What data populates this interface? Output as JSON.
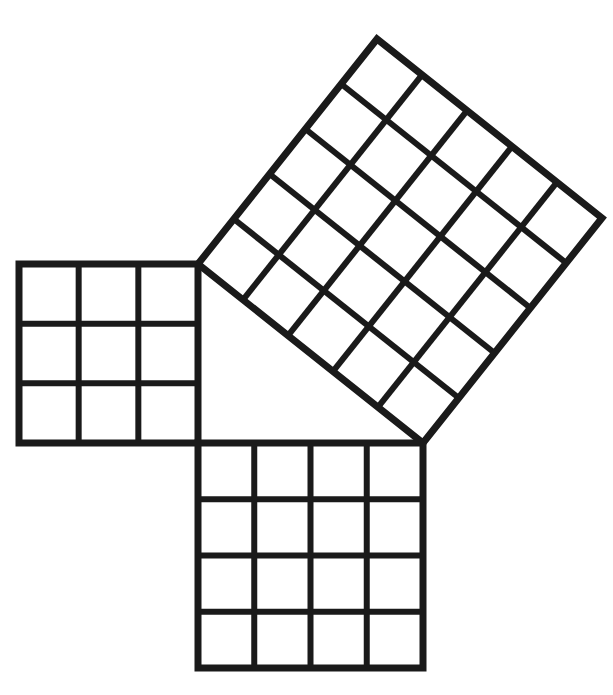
{
  "figure": {
    "background_color": "#ffffff",
    "line_color": "#1a1a1a",
    "canvas": {
      "width": 613,
      "height": 695
    },
    "triangle": {
      "name": "right-triangle",
      "vertices": {
        "right_angle": {
          "x": 198,
          "y": 443
        },
        "top": {
          "x": 198,
          "y": 264
        },
        "right": {
          "x": 423,
          "y": 443
        }
      },
      "side_lengths_units": {
        "a": 3,
        "b": 4,
        "c": 5
      }
    },
    "squares": [
      {
        "id": "square-a",
        "label": "left square",
        "side_units": 3,
        "area_units": 9,
        "grid_rows": 3,
        "grid_cols": 3,
        "orientation": "axis-aligned",
        "rotation_deg": 0,
        "corners": [
          {
            "x": 198,
            "y": 264
          },
          {
            "x": 198,
            "y": 443
          },
          {
            "x": 19,
            "y": 443
          },
          {
            "x": 19,
            "y": 264
          }
        ],
        "outer_stroke_width": 7,
        "inner_stroke_width": 6
      },
      {
        "id": "square-b",
        "label": "bottom square",
        "side_units": 4,
        "area_units": 16,
        "grid_rows": 4,
        "grid_cols": 4,
        "orientation": "axis-aligned",
        "rotation_deg": 0,
        "corners": [
          {
            "x": 198,
            "y": 443
          },
          {
            "x": 423,
            "y": 443
          },
          {
            "x": 423,
            "y": 668
          },
          {
            "x": 198,
            "y": 668
          }
        ],
        "outer_stroke_width": 7,
        "inner_stroke_width": 6
      },
      {
        "id": "square-c",
        "label": "hypotenuse square",
        "side_units": 5,
        "area_units": 25,
        "grid_rows": 5,
        "grid_cols": 5,
        "orientation": "rotated",
        "rotation_deg": -51.5,
        "corners": [
          {
            "x": 198,
            "y": 264
          },
          {
            "x": 423,
            "y": 443
          },
          {
            "x": 602,
            "y": 218
          },
          {
            "x": 377,
            "y": 39
          }
        ],
        "outer_stroke_width": 7,
        "inner_stroke_width": 6
      }
    ]
  },
  "chart_data": {
    "type": "diagram",
    "categories": [
      "a (left square)",
      "b (bottom square)",
      "c (hypotenuse square)"
    ],
    "side_lengths": [
      3,
      4,
      5
    ],
    "areas": [
      9,
      16,
      25
    ],
    "grid_counts": [
      "3 x 3",
      "4 x 4",
      "5 x 5"
    ],
    "relation": "9 + 16 = 25",
    "xlabel": "",
    "ylabel": "",
    "legend_position": "none",
    "grid": true
  }
}
